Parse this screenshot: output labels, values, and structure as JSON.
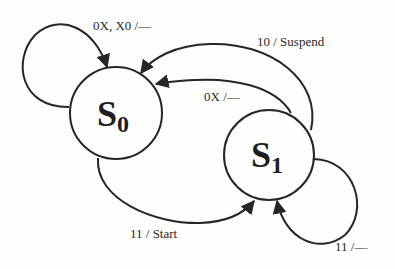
{
  "diagram": {
    "type": "finite-state-machine",
    "states": [
      {
        "id": "S0",
        "main": "S",
        "sub": "0",
        "cx": 116,
        "cy": 113,
        "r": 46
      },
      {
        "id": "S1",
        "main": "S",
        "sub": "1",
        "cx": 269,
        "cy": 155,
        "r": 45
      }
    ],
    "transitions": [
      {
        "from": "S0",
        "to": "S0",
        "label": "0X, X0 /—"
      },
      {
        "from": "S1",
        "to": "S0",
        "label": "10 / Suspend"
      },
      {
        "from": "S1",
        "to": "S0",
        "label": "0X /—"
      },
      {
        "from": "S0",
        "to": "S1",
        "label": "11 / Start"
      },
      {
        "from": "S1",
        "to": "S1",
        "label": "11 /—"
      }
    ],
    "colors": {
      "background": "#fdfdfc",
      "stroke": "#262626",
      "text": "#2a2a2a"
    }
  }
}
